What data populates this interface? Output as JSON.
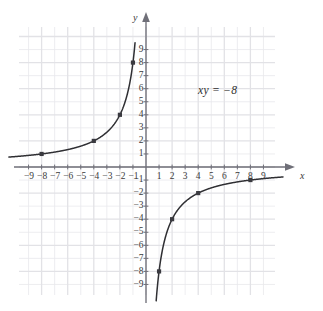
{
  "figure": {
    "background_color": "#ffffff",
    "grid_color": "#e9e9ec",
    "grid_major_color": "#e2e2e6",
    "axis_color": "#6f6f78",
    "curve_color": "#2f2f33",
    "point_color": "#3a3a40",
    "label_color": "#3a3a3a"
  },
  "annotation": {
    "equation": "xy = −8",
    "x_px": 198,
    "y_px": 84
  },
  "axes": {
    "x_axis_name": "x",
    "y_axis_name": "y",
    "origin_px": {
      "x": 146,
      "y": 167
    },
    "unit_px": 13.05,
    "x_tick_labels": [
      "−9",
      "−8",
      "−7",
      "−6",
      "−5",
      "−4",
      "−3",
      "−2",
      "−1",
      "1",
      "2",
      "3",
      "4",
      "5",
      "6",
      "7",
      "8",
      "9"
    ],
    "x_tick_values": [
      -9,
      -8,
      -7,
      -6,
      -5,
      -4,
      -3,
      -2,
      -1,
      1,
      2,
      3,
      4,
      5,
      6,
      7,
      8,
      9
    ],
    "y_tick_labels": [
      "9",
      "8",
      "7",
      "6",
      "5",
      "4",
      "3",
      "2",
      "1",
      "−1",
      "−2",
      "−3",
      "−4",
      "−5",
      "−6",
      "−7",
      "−8",
      "−9"
    ],
    "y_tick_values": [
      9,
      8,
      7,
      6,
      5,
      4,
      3,
      2,
      1,
      -1,
      -2,
      -3,
      -4,
      -5,
      -6,
      -7,
      -8,
      -9
    ]
  },
  "chart_data": {
    "type": "line",
    "title": "",
    "subtitle": "",
    "xlabel": "x",
    "ylabel": "y",
    "equation": "xy = −8",
    "function": "y = -8/x",
    "grid": true,
    "legend": "none",
    "xlim": [
      -10.5,
      10.5
    ],
    "ylim": [
      -10.0,
      10.0
    ],
    "xticks": [
      -9,
      -8,
      -7,
      -6,
      -5,
      -4,
      -3,
      -2,
      -1,
      1,
      2,
      3,
      4,
      5,
      6,
      7,
      8,
      9
    ],
    "yticks": [
      9,
      8,
      7,
      6,
      5,
      4,
      3,
      2,
      1,
      -1,
      -2,
      -3,
      -4,
      -5,
      -6,
      -7,
      -8,
      -9
    ],
    "series": [
      {
        "name": "branch-upper-left",
        "quadrant": 2,
        "x_range": [
          -10.5,
          -0.84
        ],
        "marked_points": [
          {
            "x": -8,
            "y": 1
          },
          {
            "x": -4,
            "y": 2
          },
          {
            "x": -2,
            "y": 4
          },
          {
            "x": -1,
            "y": 8
          }
        ]
      },
      {
        "name": "branch-lower-right",
        "quadrant": 4,
        "x_range": [
          0.78,
          10.5
        ],
        "marked_points": [
          {
            "x": 1,
            "y": -8
          },
          {
            "x": 2,
            "y": -4
          },
          {
            "x": 4,
            "y": -2
          },
          {
            "x": 8,
            "y": -1
          }
        ]
      }
    ]
  }
}
